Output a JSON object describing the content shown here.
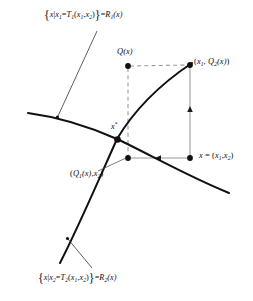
{
  "figure": {
    "type": "mathematical-diagram",
    "background_color": "#ffffff",
    "ink_color": "#0d0d0d",
    "guide_color": "#9a9a9a",
    "width": 253,
    "height": 301
  },
  "labels": {
    "set_top": {
      "open_brace": "{",
      "body_pre": "x",
      "bar": "|",
      "lhs_var": "x",
      "lhs_sub": "1",
      "equals": "=",
      "map": "T",
      "map_sub": "1",
      "args_open": "(",
      "arg1": "x",
      "arg1_sub": "1",
      "comma": ",",
      "arg2": "x",
      "arg2_sub": "2",
      "args_close": ")",
      "close_brace": "}",
      "result_equals": "=",
      "result": "R",
      "result_sub": "1",
      "result_arg": "(x)",
      "plain": "{x | x1 = T1(x1, x2)} = R1(x)"
    },
    "set_bottom": {
      "open_brace": "{",
      "body_pre": "x",
      "bar": "|",
      "lhs_var": "x",
      "lhs_sub": "2",
      "equals": "=",
      "map": "T",
      "map_sub": "2",
      "args_open": "(",
      "arg1": "x",
      "arg1_sub": "1",
      "comma": ",",
      "arg2": "x",
      "arg2_sub": "2",
      "args_close": ")",
      "close_brace": "}",
      "result_equals": "=",
      "result": "R",
      "result_sub": "2",
      "result_arg": "(x)",
      "plain": "{x | x2 = T2(x1, x2)} = R2(x)"
    },
    "q_of_x": {
      "text": "Q(x)",
      "head": "Q",
      "arg": "(x)"
    },
    "upper_right_point": {
      "open": "(",
      "first": "x",
      "first_sub": "1",
      "comma": ", ",
      "second": "Q",
      "second_sub": "2",
      "second_arg": "(x)",
      "close": ")",
      "plain": "(x1, Q2(x))"
    },
    "lower_right_point": {
      "var": "x",
      "equals": " = ",
      "open": "(",
      "first": "x",
      "first_sub": "1",
      "comma": ",",
      "second": "x",
      "second_sub": "2",
      "close": ")",
      "plain": "x = (x1, x2)"
    },
    "lower_left_point": {
      "open": "(",
      "first": "Q",
      "first_sub": "1",
      "first_arg": "(x)",
      "comma": ",",
      "second": "x",
      "second_sub": "2",
      "close": ")",
      "plain": "(Q1(x), x2)"
    },
    "fixed_point": {
      "var": "x",
      "star": "*",
      "plain": "x*"
    }
  },
  "geometry": {
    "curve_R1": {
      "name": "reaction-curve-R1",
      "description": "decreasing curve from upper-left to lower-right",
      "path": "M 28,113 C 60,118 92,128 118,140 C 146,153 186,175 228,192"
    },
    "curve_R2": {
      "name": "reaction-curve-R2",
      "description": "increasing curve from lower-left to upper-right",
      "path": "M 60,262 C 80,225 100,178 118,140 C 140,103 168,80 192,64"
    },
    "leader_top": {
      "name": "leader-line-top",
      "path": "M 96,32 L 57,117"
    },
    "leader_bottom": {
      "name": "leader-line-bottom",
      "path": "M 91,268 L 67,238"
    },
    "points": [
      {
        "name": "point-q-of-x",
        "x": 128,
        "y": 66
      },
      {
        "name": "point-x1-q2x",
        "x": 190,
        "y": 65
      },
      {
        "name": "point-x",
        "x": 190,
        "y": 158
      },
      {
        "name": "point-q1x-x2",
        "x": 128,
        "y": 158
      },
      {
        "name": "point-x-star",
        "x": 118,
        "y": 140
      }
    ],
    "dashed_guides": [
      {
        "name": "dashed-horizontal-top",
        "x1": 128,
        "y1": 66,
        "x2": 190,
        "y2": 65
      },
      {
        "name": "dashed-vertical-left",
        "x1": 128,
        "y1": 66,
        "x2": 128,
        "y2": 158
      }
    ],
    "solid_arrows": [
      {
        "name": "arrow-bottom-leftward",
        "x1": 190,
        "y1": 158,
        "x2": 128,
        "y2": 158,
        "direction": "left"
      },
      {
        "name": "arrow-right-upward",
        "x1": 190,
        "y1": 158,
        "x2": 190,
        "y2": 65,
        "direction": "up"
      }
    ]
  }
}
